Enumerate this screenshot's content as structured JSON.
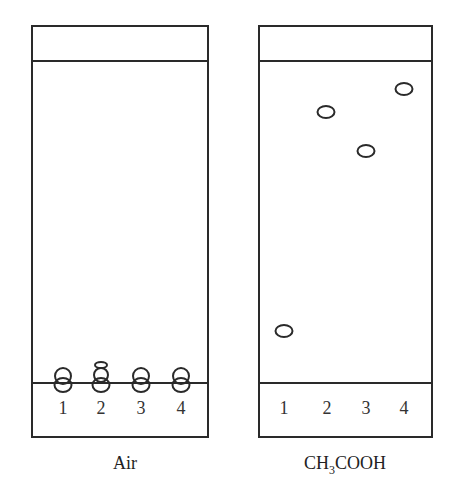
{
  "plates": [
    {
      "id": "left",
      "label": "Air",
      "lanes": [
        "1",
        "2",
        "3",
        "4"
      ],
      "spots_note": "all spots remain at origin"
    },
    {
      "id": "right",
      "label_main": "CH",
      "label_sub": "3",
      "label_rest": "COOH",
      "lanes": [
        "1",
        "2",
        "3",
        "4"
      ],
      "spots_note": "spots migrated to different heights"
    }
  ]
}
